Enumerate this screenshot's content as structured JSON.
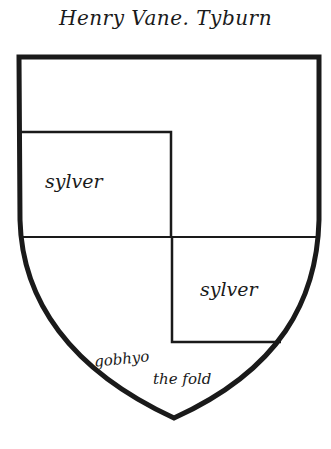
{
  "caption": "Henry Vane. Tyburn",
  "shield": {
    "stroke_color": "#1a1a1a",
    "background": "#ffffff",
    "regions": [
      {
        "name": "upper-left-quarter",
        "label": "sylver"
      },
      {
        "name": "lower-right-quarter",
        "label": "sylver"
      }
    ]
  },
  "labels": {
    "tincture_upper_left": "sylver",
    "tincture_lower_right": "sylver",
    "motto_line_1": "gobhyo",
    "motto_line_2": "the fold"
  }
}
